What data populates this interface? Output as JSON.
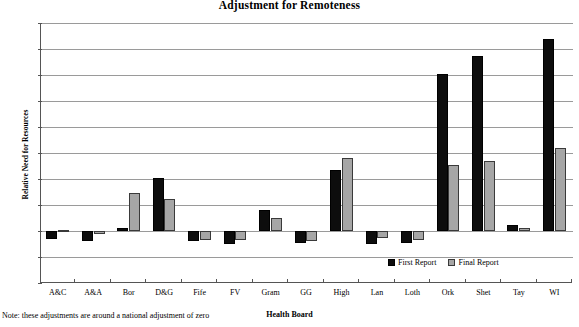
{
  "chart_data": {
    "type": "bar",
    "title": "Adjustment for Remoteness",
    "xlabel": "Health Board",
    "ylabel": "Relative Need for Resources",
    "categories": [
      "A&C",
      "A&A",
      "Bor",
      "D&G",
      "Fife",
      "FV",
      "Gram",
      "GG",
      "High",
      "Lan",
      "Loth",
      "Ork",
      "Shet",
      "Tay",
      "WI"
    ],
    "series": [
      {
        "name": "First Report",
        "color": "#0d0d0d",
        "values": [
          -3,
          -4,
          1,
          20.5,
          -4,
          -5,
          8,
          -4.5,
          23.5,
          -5,
          -4.5,
          60.5,
          67.5,
          2.5,
          74
        ]
      },
      {
        "name": "Final Report",
        "color": "#a6a6a6",
        "values": [
          0.5,
          -1,
          14.5,
          12.5,
          -3.5,
          -3.5,
          5,
          -4,
          28,
          -2.5,
          -3.5,
          25.5,
          27,
          1,
          32
        ]
      }
    ],
    "ylim": [
      -20,
      80
    ],
    "ytick_labels": [
      "80%",
      "70%",
      "60%",
      "50%",
      "40%",
      "30%",
      "20%",
      "10%",
      "0%",
      "-10%",
      "-20%"
    ],
    "ytick_values": [
      80,
      70,
      60,
      50,
      40,
      30,
      20,
      10,
      0,
      -10,
      -20
    ],
    "grid": true,
    "legend_position": "inside-bottom-right",
    "note": "Note: these adjustments are around a national adjustment of zero"
  }
}
